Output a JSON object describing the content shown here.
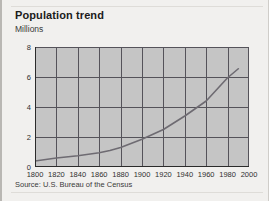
{
  "card": {
    "title": "Population trend",
    "source": "Source: U.S. Bureau of the Census"
  },
  "colors": {
    "plot_background": "#c5c5c5",
    "card_background": "#f1f0ee",
    "gridline": "#55535a",
    "axis": "#2b2b2b",
    "series_line": "#6e6b72",
    "text": "#1b1b1b"
  },
  "chart_data": {
    "type": "line",
    "title": "Population trend",
    "subtitle": "",
    "xlabel": "",
    "ylabel": "Millions",
    "xlim": [
      1800,
      2000
    ],
    "ylim": [
      0,
      8
    ],
    "grid": true,
    "legend": false,
    "xticks": [
      1800,
      1820,
      1840,
      1860,
      1880,
      1900,
      1920,
      1940,
      1960,
      1980,
      2000
    ],
    "xtick_labels": [
      "1800",
      "1820",
      "1840",
      "1860",
      "1880",
      "1900",
      "1920",
      "1940",
      "1960",
      "1980",
      "2000"
    ],
    "yticks": [
      0,
      2,
      4,
      6,
      8
    ],
    "ytick_labels": [
      "0",
      "2",
      "4",
      "6",
      "8"
    ],
    "series": [
      {
        "name": "Population",
        "units": "Millions",
        "x": [
          1800,
          1820,
          1840,
          1860,
          1870,
          1880,
          1900,
          1920,
          1940,
          1950,
          1960,
          1980,
          1990
        ],
        "values": [
          0.4,
          0.6,
          0.75,
          0.95,
          1.1,
          1.3,
          1.85,
          2.5,
          3.4,
          3.9,
          4.4,
          5.95,
          6.55
        ]
      }
    ],
    "annotations": [
      "Source: U.S. Bureau of the Census"
    ]
  }
}
